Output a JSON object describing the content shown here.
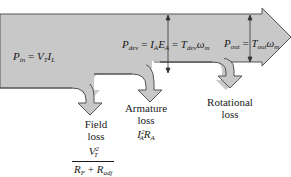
{
  "diagram": {
    "type": "power-flow",
    "colors": {
      "fill": "#c8c8c8",
      "stroke": "#555555",
      "text": "#1a1a1a",
      "background": "#ffffff"
    },
    "input_power": {
      "label": "P_in = V_T I_L",
      "P": "P",
      "in": "in",
      "eq": "=",
      "V": "V",
      "T": "T",
      "I": "I",
      "L": "L"
    },
    "developed_power": {
      "label": "P_dev = I_A E_A = T_dev ω_m",
      "P": "P",
      "dev": "dev",
      "eq": "=",
      "I": "I",
      "A": "A",
      "E": "E",
      "A2": "A",
      "eq2": "=",
      "T": "T",
      "dev2": "dev",
      "omega": "ω",
      "m": "m"
    },
    "output_power": {
      "label": "P_out = T_out ω_m",
      "P": "P",
      "out": "out",
      "eq": "=",
      "T": "T",
      "out2": "out",
      "omega": "ω",
      "m": "m"
    },
    "losses": [
      {
        "name": "Field loss",
        "line1": "Field",
        "line2": "loss",
        "formula_num": "V_T^2",
        "num_V": "V",
        "num_T": "T",
        "num_exp": "2",
        "den_R1": "R",
        "den_F": "F",
        "den_plus": "+",
        "den_R2": "R",
        "den_adj": "adj"
      },
      {
        "name": "Armature loss",
        "line1": "Armature",
        "line2": "loss",
        "I": "I",
        "A": "A",
        "exp": "2",
        "R": "R",
        "A2": "A"
      },
      {
        "name": "Rotational loss",
        "line1": "Rotational",
        "line2": "loss"
      }
    ]
  }
}
